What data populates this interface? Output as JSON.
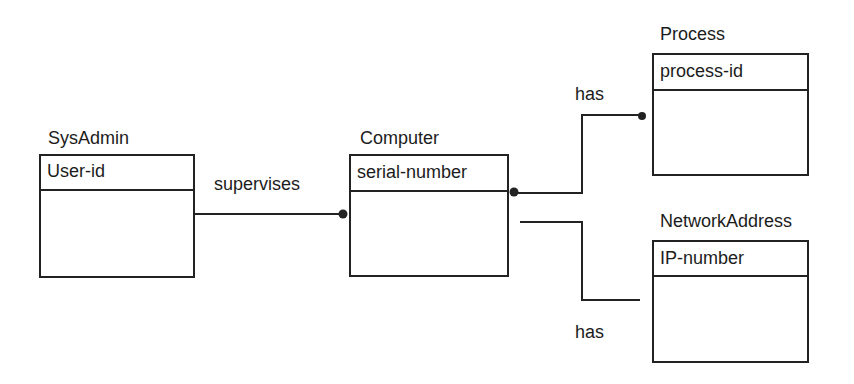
{
  "diagram": {
    "type": "entity-relationship",
    "entities": [
      {
        "id": "sysadmin",
        "name": "SysAdmin",
        "key": "User-id"
      },
      {
        "id": "computer",
        "name": "Computer",
        "key": "serial-number"
      },
      {
        "id": "process",
        "name": "Process",
        "key": "process-id"
      },
      {
        "id": "networkaddress",
        "name": "NetworkAddress",
        "key": "IP-number"
      }
    ],
    "relationships": [
      {
        "label": "supervises",
        "from": "SysAdmin",
        "to": "Computer"
      },
      {
        "label": "has",
        "from": "Computer",
        "to": "Process"
      },
      {
        "label": "has",
        "from": "Computer",
        "to": "NetworkAddress"
      }
    ],
    "colors": {
      "stroke": "#222222",
      "background": "#ffffff"
    }
  }
}
